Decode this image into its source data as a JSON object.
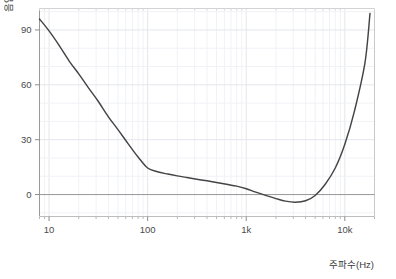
{
  "chart_data": {
    "type": "line",
    "title": "",
    "xlabel": "주파수(Hz)",
    "ylabel": "음압(dB)",
    "xscale": "log",
    "xlim": [
      8,
      20000
    ],
    "ylim": [
      -12,
      102
    ],
    "grid": true,
    "legend": null,
    "xticks": [
      {
        "value": 10,
        "label": "10"
      },
      {
        "value": 100,
        "label": "100"
      },
      {
        "value": 1000,
        "label": "1k"
      },
      {
        "value": 10000,
        "label": "10k"
      }
    ],
    "yticks": [
      {
        "value": 0,
        "label": "0"
      },
      {
        "value": 30,
        "label": "30"
      },
      {
        "value": 60,
        "label": "60"
      },
      {
        "value": 90,
        "label": "90"
      }
    ],
    "series": [
      {
        "name": "최소가청음압",
        "color": "#444444",
        "x": [
          8,
          10,
          12.5,
          16,
          20,
          25,
          31.5,
          40,
          50,
          63,
          80,
          100,
          125,
          160,
          200,
          250,
          315,
          400,
          500,
          630,
          800,
          1000,
          1250,
          1600,
          2000,
          2500,
          3150,
          4000,
          5000,
          6300,
          8000,
          10000,
          12500,
          16000,
          18000
        ],
        "y": [
          96,
          89.5,
          82,
          73,
          66,
          58.5,
          51,
          42.5,
          35.5,
          28,
          20.5,
          14.5,
          12.5,
          11.2,
          10.2,
          9.3,
          8.4,
          7.5,
          6.6,
          5.6,
          4.6,
          3.2,
          1.3,
          -0.6,
          -2.2,
          -3.6,
          -4.2,
          -3.4,
          -0.5,
          5.5,
          14.5,
          27.5,
          45.5,
          72,
          99
        ]
      }
    ]
  },
  "colors": {
    "curve": "#444444",
    "grid_major": "#e4e6ec",
    "grid_minor": "#f1f2f6",
    "axis": "#9a9a9a",
    "zero_line": "#9a9a9a",
    "tick_text": "#4a4a4a",
    "background": "#ffffff"
  }
}
